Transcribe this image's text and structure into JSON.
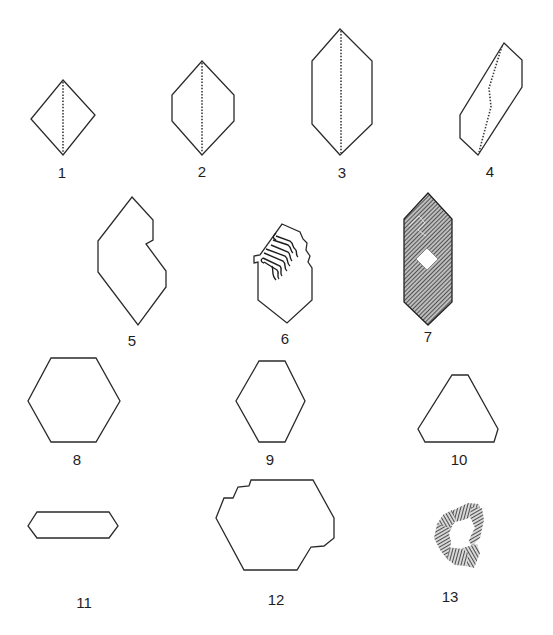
{
  "figure": {
    "title": "",
    "colors": {
      "stroke": "#2a2a2a",
      "hatch": "#333333",
      "background": "#ffffff"
    },
    "shapes": [
      {
        "id": 1,
        "label": "1",
        "description": "rhombus with dotted vertical median"
      },
      {
        "id": 2,
        "label": "2",
        "description": "elongated hexagon with dotted vertical median"
      },
      {
        "id": 3,
        "label": "3",
        "description": "tall hexagon with dotted vertical median"
      },
      {
        "id": 4,
        "label": "4",
        "description": "slanted hexagon with dotted bent line"
      },
      {
        "id": 5,
        "label": "5",
        "description": "hexagon with re-entrant notch"
      },
      {
        "id": 6,
        "label": "6",
        "description": "hexagon with hatched growth-spiral inclusion"
      },
      {
        "id": 7,
        "label": "7",
        "description": "hatched hexagon with central white square"
      },
      {
        "id": 8,
        "label": "8",
        "description": "regular hexagon"
      },
      {
        "id": 9,
        "label": "9",
        "description": "elongated hexagon"
      },
      {
        "id": 10,
        "label": "10",
        "description": "truncated triangle"
      },
      {
        "id": 11,
        "label": "11",
        "description": "flat elongated hexagon"
      },
      {
        "id": 12,
        "label": "12",
        "description": "hexagon with stepped edges"
      },
      {
        "id": 13,
        "label": "13",
        "description": "hatched hexagonal ring (skeletal crystal)"
      }
    ]
  }
}
